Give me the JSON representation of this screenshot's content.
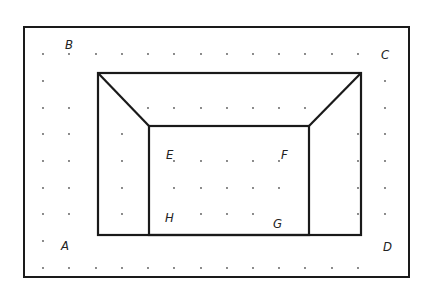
{
  "diagram": {
    "type": "dot-grid geometric figure",
    "colors": {
      "line": "#1a1a1a",
      "dot": "#555555",
      "background": "#ffffff",
      "label": "#222222"
    },
    "frame": {
      "x1": 24,
      "y1": 27,
      "x2": 409,
      "y2": 277
    },
    "grid": {
      "xs": [
        43,
        69,
        96,
        122,
        148,
        174,
        201,
        227,
        253,
        279,
        305,
        332,
        358,
        385
      ],
      "ys": [
        54,
        81,
        108,
        134,
        161,
        188,
        214,
        241,
        268
      ],
      "visible": [
        [
          0,
          1,
          2,
          3,
          4,
          5,
          6,
          7,
          8,
          9,
          10,
          11,
          12
        ],
        [
          0,
          13
        ],
        [
          0,
          1,
          4,
          5,
          6,
          7,
          8,
          9,
          10,
          13
        ],
        [
          0,
          1,
          3,
          12,
          13
        ],
        [
          0,
          1,
          3,
          5,
          6,
          7,
          8,
          9,
          12,
          13
        ],
        [
          0,
          1,
          3,
          5,
          6,
          7,
          8,
          9,
          12,
          13
        ],
        [
          0,
          1,
          3,
          6,
          7,
          8,
          12,
          13
        ],
        [
          0
        ],
        [
          0,
          1,
          2,
          3,
          4,
          5,
          6,
          7,
          8,
          9,
          10,
          11,
          12
        ]
      ]
    },
    "shapes": {
      "outer_rect": {
        "x1": 98,
        "y1": 73,
        "x2": 361,
        "y2": 235
      },
      "inner_rect": {
        "x1": 149,
        "y1": 126,
        "x2": 309,
        "y2": 235
      },
      "diagonals": [
        {
          "x1": 98,
          "y1": 73,
          "x2": 149,
          "y2": 126
        },
        {
          "x1": 361,
          "y1": 73,
          "x2": 309,
          "y2": 126
        }
      ]
    },
    "labels": [
      {
        "text": "A",
        "x": 61,
        "y": 250
      },
      {
        "text": "B",
        "x": 65,
        "y": 49
      },
      {
        "text": "C",
        "x": 381,
        "y": 59
      },
      {
        "text": "D",
        "x": 383,
        "y": 251
      },
      {
        "text": "E",
        "x": 166,
        "y": 159
      },
      {
        "text": "F",
        "x": 281,
        "y": 159
      },
      {
        "text": "G",
        "x": 273,
        "y": 228
      },
      {
        "text": "H",
        "x": 165,
        "y": 222
      }
    ]
  }
}
